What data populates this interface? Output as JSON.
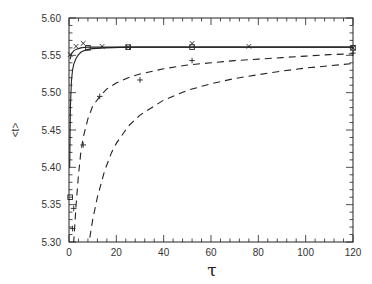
{
  "chart_data": {
    "type": "line",
    "title": "",
    "xlabel": "τ",
    "ylabel": "<t>",
    "xlim": [
      0,
      120
    ],
    "ylim": [
      5.3,
      5.6
    ],
    "x_ticks": [
      0,
      20,
      40,
      60,
      80,
      100,
      120
    ],
    "x_tick_labels": [
      "0",
      "20",
      "40",
      "60",
      "80",
      "100",
      "120"
    ],
    "y_ticks": [
      5.3,
      5.35,
      5.4,
      5.45,
      5.5,
      5.55,
      5.6
    ],
    "y_tick_labels": [
      "5.30",
      "5.35",
      "5.40",
      "5.45",
      "5.50",
      "5.55",
      "5.60"
    ],
    "grid": false,
    "legend": null,
    "series": [
      {
        "name": "solid curve (upper)",
        "style": "solid",
        "x": [
          0.5,
          1,
          2,
          3,
          4,
          5,
          6,
          8,
          10,
          15,
          25,
          50,
          80,
          120
        ],
        "values": [
          5.545,
          5.552,
          5.556,
          5.558,
          5.559,
          5.56,
          5.5605,
          5.561,
          5.561,
          5.561,
          5.561,
          5.561,
          5.561,
          5.561
        ]
      },
      {
        "name": "solid curve (lower)",
        "style": "solid",
        "x": [
          0.3,
          0.6,
          1,
          1.5,
          2,
          3,
          4,
          5,
          6,
          8,
          10,
          15,
          25,
          120
        ],
        "values": [
          5.4,
          5.48,
          5.515,
          5.53,
          5.538,
          5.546,
          5.551,
          5.554,
          5.556,
          5.558,
          5.559,
          5.56,
          5.561,
          5.561
        ]
      },
      {
        "name": "dashed curve (fast)",
        "style": "dashed",
        "x": [
          1,
          2,
          3,
          4,
          5,
          6,
          8,
          10,
          13,
          16,
          20,
          25,
          30,
          40,
          50,
          60,
          70,
          80,
          90,
          100,
          110,
          120
        ],
        "values": [
          5.25,
          5.3,
          5.35,
          5.39,
          5.42,
          5.44,
          5.465,
          5.482,
          5.495,
          5.505,
          5.513,
          5.52,
          5.525,
          5.532,
          5.537,
          5.54,
          5.543,
          5.545,
          5.547,
          5.549,
          5.551,
          5.552
        ]
      },
      {
        "name": "dashed curve (slow)",
        "style": "dashed",
        "x": [
          8,
          10,
          12,
          15,
          18,
          20,
          25,
          30,
          40,
          50,
          60,
          70,
          80,
          90,
          100,
          110,
          120
        ],
        "values": [
          5.29,
          5.33,
          5.36,
          5.395,
          5.42,
          5.432,
          5.455,
          5.47,
          5.49,
          5.503,
          5.512,
          5.519,
          5.524,
          5.529,
          5.533,
          5.536,
          5.539
        ]
      },
      {
        "name": "x markers",
        "marker": "x",
        "x": [
          0.5,
          3,
          6,
          14,
          25,
          52,
          76,
          120
        ],
        "values": [
          5.551,
          5.562,
          5.566,
          5.562,
          5.561,
          5.566,
          5.562,
          5.56
        ]
      },
      {
        "name": "square markers",
        "marker": "square",
        "x": [
          0.5,
          8,
          25,
          52,
          120
        ],
        "values": [
          5.36,
          5.56,
          5.561,
          5.561,
          5.56
        ]
      },
      {
        "name": "plus markers",
        "marker": "plus",
        "x": [
          1.5,
          2,
          6,
          13,
          30,
          52,
          120
        ],
        "values": [
          5.318,
          5.345,
          5.43,
          5.495,
          5.517,
          5.543,
          5.553
        ]
      }
    ]
  },
  "plot": {
    "left": 69,
    "right": 353,
    "top": 18,
    "bottom": 242
  }
}
